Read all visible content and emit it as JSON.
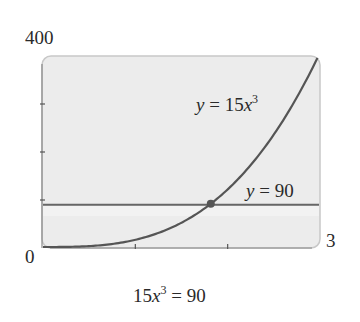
{
  "chart_data": {
    "type": "line",
    "title": "",
    "caption": "15x³ = 90",
    "xlabel": "",
    "ylabel": "",
    "xlim": [
      0,
      3
    ],
    "ylim": [
      0,
      400
    ],
    "x_tick_labels": {
      "min": "0",
      "max": "3"
    },
    "y_tick_labels": {
      "max": "400"
    },
    "x_ticks": [
      1,
      2
    ],
    "y_ticks": [
      100,
      200,
      300
    ],
    "grid": false,
    "series": [
      {
        "name": "y = 15x³",
        "expr": "15*x^3",
        "coef": 15,
        "power": 3,
        "label": {
          "base": "y = 15x",
          "sup": "3"
        },
        "color": "#555555"
      },
      {
        "name": "y = 90",
        "expr": "90",
        "constant": 90,
        "label": {
          "base": "y = 90",
          "sup": ""
        },
        "color": "#666666"
      }
    ],
    "intersection": {
      "x": 1.817,
      "y": 90,
      "color": "#555555"
    },
    "caption_parts": {
      "lhs_base": "15x",
      "lhs_sup": "3",
      "rhs": " = 90"
    },
    "colors": {
      "plot_bg": "#ececec",
      "frame": "#c8c8c8",
      "lower_band": "#f2f2f2"
    }
  }
}
